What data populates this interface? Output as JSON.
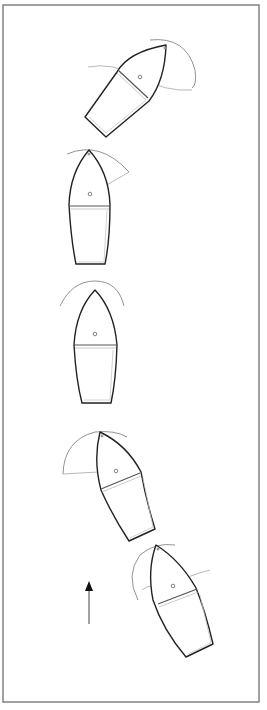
{
  "figure": {
    "frame_color": "#7a7a7a",
    "hull_stroke_color": "#222222",
    "guide_color": "#999999",
    "boats": [
      {
        "id": "boat-1",
        "position": "top",
        "heading": "bow pointing up-right (~45deg)"
      },
      {
        "id": "boat-2",
        "position": "second",
        "heading": "bow pointing up, tiller line swung to upper right"
      },
      {
        "id": "boat-3",
        "position": "middle",
        "heading": "bow pointing straight up, centerline straight"
      },
      {
        "id": "boat-4",
        "position": "fourth",
        "heading": "bow pointing up-left, tiller line swung to left"
      },
      {
        "id": "boat-5",
        "position": "bottom",
        "heading": "bow pointing up-left, sweep arcs to left and right"
      }
    ],
    "arrow": {
      "direction": "up",
      "meaning": "direction indicator"
    },
    "caption": ""
  }
}
